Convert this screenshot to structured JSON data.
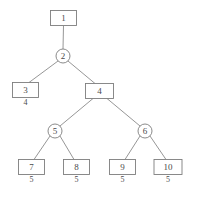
{
  "diagram": {
    "type": "tree",
    "background_color": "#ffffff",
    "stroke_color": "#7d7d7d",
    "text_color": "#4a4a4a",
    "nodes": [
      {
        "id": "n1",
        "label": "1",
        "shape": "rect",
        "cx": 63.5,
        "cy": 18,
        "w": 26,
        "h": 15,
        "sub_label": ""
      },
      {
        "id": "n2",
        "label": "2",
        "shape": "circle",
        "cx": 63,
        "cy": 56,
        "r": 7,
        "sub_label": ""
      },
      {
        "id": "n3",
        "label": "3",
        "shape": "rect",
        "cx": 25.5,
        "cy": 90,
        "w": 26,
        "h": 15,
        "sub_label": "4"
      },
      {
        "id": "n4",
        "label": "4",
        "shape": "rect",
        "cx": 99.5,
        "cy": 91,
        "w": 28,
        "h": 15,
        "sub_label": ""
      },
      {
        "id": "n5",
        "label": "5",
        "shape": "circle",
        "cx": 55,
        "cy": 131,
        "r": 7,
        "sub_label": ""
      },
      {
        "id": "n6",
        "label": "6",
        "shape": "circle",
        "cx": 145,
        "cy": 131,
        "r": 7,
        "sub_label": ""
      },
      {
        "id": "n7",
        "label": "7",
        "shape": "rect",
        "cx": 31.5,
        "cy": 167,
        "w": 26,
        "h": 15,
        "sub_label": "5"
      },
      {
        "id": "n8",
        "label": "8",
        "shape": "rect",
        "cx": 76.5,
        "cy": 167,
        "w": 26,
        "h": 15,
        "sub_label": "5"
      },
      {
        "id": "n9",
        "label": "9",
        "shape": "rect",
        "cx": 122.5,
        "cy": 167,
        "w": 26,
        "h": 15,
        "sub_label": "5"
      },
      {
        "id": "n10",
        "label": "10",
        "shape": "rect",
        "cx": 168,
        "cy": 167,
        "w": 28,
        "h": 15,
        "sub_label": "5"
      }
    ],
    "edges": [
      {
        "from": "n1",
        "to": "n2",
        "x1": 63.5,
        "y1": 25.5,
        "x2": 63,
        "y2": 49
      },
      {
        "from": "n2",
        "to": "n3",
        "x1": 58,
        "y1": 61,
        "x2": 29,
        "y2": 82.5
      },
      {
        "from": "n2",
        "to": "n4",
        "x1": 68,
        "y1": 61,
        "x2": 95,
        "y2": 83.5
      },
      {
        "from": "n4",
        "to": "n5",
        "x1": 93,
        "y1": 98.5,
        "x2": 60,
        "y2": 126
      },
      {
        "from": "n4",
        "to": "n6",
        "x1": 107,
        "y1": 98.5,
        "x2": 140,
        "y2": 126
      },
      {
        "from": "n5",
        "to": "n7",
        "x1": 50,
        "y1": 136,
        "x2": 34,
        "y2": 159.5
      },
      {
        "from": "n5",
        "to": "n8",
        "x1": 60,
        "y1": 136,
        "x2": 74,
        "y2": 159.5
      },
      {
        "from": "n6",
        "to": "n9",
        "x1": 140,
        "y1": 136,
        "x2": 125,
        "y2": 159.5
      },
      {
        "from": "n6",
        "to": "n10",
        "x1": 150,
        "y1": 136,
        "x2": 166,
        "y2": 159.5
      }
    ]
  }
}
